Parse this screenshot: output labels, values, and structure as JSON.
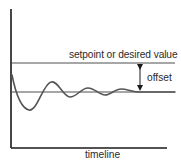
{
  "diagram": {
    "labels": {
      "setpoint": "setpoint or desired value",
      "offset": "offset",
      "x_axis": "timeline"
    },
    "colors": {
      "axis": "#1a1a1a",
      "reference_lines": "#3a3a3a",
      "response_curve": "#555555",
      "text": "#2a2a2a",
      "background": "#ffffff"
    },
    "elements": {
      "y_axis": {
        "x": 11,
        "y_top": 9,
        "y_bottom": 148
      },
      "x_axis": {
        "y": 148,
        "x_left": 11,
        "x_right": 167
      },
      "setpoint_line": {
        "y": 63,
        "x_start": 11,
        "x_end": 175
      },
      "steady_state_line": {
        "y": 92,
        "x_start": 11,
        "x_end": 175
      },
      "offset_arrow": {
        "x": 140,
        "y_top": 64,
        "y_bottom": 91
      }
    },
    "response_curve": {
      "description": "damped oscillation settling below setpoint",
      "points": [
        [
          12,
          75
        ],
        [
          18,
          92
        ],
        [
          28,
          110
        ],
        [
          40,
          100
        ],
        [
          50,
          82
        ],
        [
          60,
          88
        ],
        [
          70,
          97
        ],
        [
          87,
          88
        ],
        [
          105,
          95
        ],
        [
          120,
          89
        ],
        [
          140,
          92
        ],
        [
          175,
          92
        ]
      ]
    }
  }
}
